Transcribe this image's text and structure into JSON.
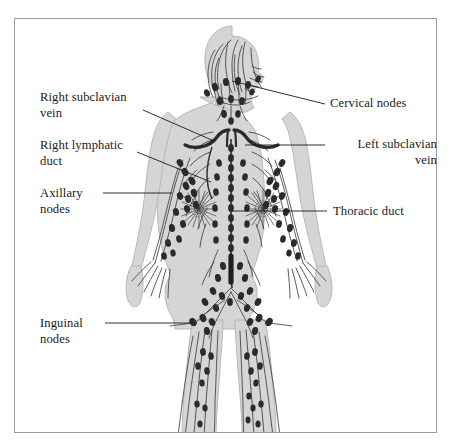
{
  "figure": {
    "border_color": "#9a9a9a",
    "background_color": "#ffffff",
    "body_fill_color": "#d5d5d5",
    "body_outline_color": "#b0b0b0",
    "vessel_color": "#3a3a3a",
    "node_color": "#2b2b2b",
    "duct_color": "#262626",
    "leader_line_color": "#1a1a1a"
  },
  "labels": [
    {
      "id": "right-subclavian-vein",
      "text": "Right subclavian\nvein",
      "side": "left",
      "x": 40,
      "y": 90,
      "leader": {
        "x1": 143,
        "y1": 110,
        "x2": 214,
        "y2": 141
      }
    },
    {
      "id": "right-lymphatic-duct",
      "text": "Right lymphatic\nduct",
      "side": "left",
      "x": 40,
      "y": 138,
      "leader": {
        "x1": 137,
        "y1": 152,
        "x2": 211,
        "y2": 182
      }
    },
    {
      "id": "axillary-nodes",
      "text": "Axillary\nnodes",
      "side": "left",
      "x": 40,
      "y": 186,
      "leader": {
        "x1": 103,
        "y1": 193,
        "x2": 172,
        "y2": 193
      }
    },
    {
      "id": "inguinal-nodes",
      "text": "Inguinal\nnodes",
      "side": "left",
      "x": 40,
      "y": 316,
      "leader": {
        "x1": 105,
        "y1": 323,
        "x2": 192,
        "y2": 323
      }
    },
    {
      "id": "cervical-nodes",
      "text": "Cervical nodes",
      "side": "right",
      "x": 330,
      "y": 96,
      "leader": {
        "x1": 325,
        "y1": 104,
        "x2": 232,
        "y2": 81
      }
    },
    {
      "id": "left-subclavian-vein",
      "text": "Left subclavian\nvein",
      "side": "right",
      "x": 330,
      "y": 137,
      "leader": {
        "x1": 325,
        "y1": 145,
        "x2": 245,
        "y2": 145
      }
    },
    {
      "id": "thoracic-duct",
      "text": "Thoracic duct",
      "side": "right",
      "x": 333,
      "y": 204,
      "leader": {
        "x1": 327,
        "y1": 211,
        "x2": 232,
        "y2": 211
      }
    }
  ],
  "structures": [
    {
      "name": "head-scalp-lymphatics",
      "description": "branching vessels through hair/scalp"
    },
    {
      "name": "cervical-nodes-chain",
      "description": "nodes along the neck"
    },
    {
      "name": "subclavian-veins",
      "description": "paired thick dark arcs at the clavicles"
    },
    {
      "name": "thoracic-duct",
      "description": "beaded midline duct from neck to cisterna chyli"
    },
    {
      "name": "cisterna-chyli",
      "description": "thick dark segment in lower abdomen"
    },
    {
      "name": "axillary-nodes",
      "description": "node clusters at the armpits"
    },
    {
      "name": "breast-lymphatics",
      "description": "radial sunburst plexus over each breast"
    },
    {
      "name": "arm-lymphatics",
      "description": "node chains down both arms into the hands"
    },
    {
      "name": "iliac-inguinal-nodes",
      "description": "V-shaped node chains in the pelvis and groin"
    },
    {
      "name": "leg-lymphatics",
      "description": "vessels and nodes descending both legs"
    }
  ]
}
